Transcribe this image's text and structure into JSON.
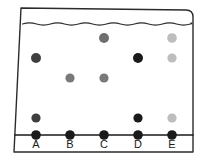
{
  "figure": {
    "background_color": "#ffffff",
    "stroke_color": "#2b2b2b",
    "stroke_width": 1.4,
    "width": 208,
    "height": 160
  },
  "container": {
    "name": "container-outline",
    "description": "Hand-drawn open-top vessel with slightly slanted left wall and rounded top-right corner",
    "left_top_x": 21,
    "left_bottom_x": 14,
    "right_x": 193,
    "top_y": 8,
    "baseline_y": 135,
    "bottom_y": 152,
    "corner_radius": 7
  },
  "fluid_line": {
    "name": "wavy-fluid-line",
    "y": 24,
    "amplitude": 2.2,
    "wavelength": 14,
    "color": "#2b2b2b"
  },
  "baseline": {
    "name": "baseline-axis",
    "y": 135,
    "x_start": 15,
    "x_end": 193,
    "color": "#1a1a1a",
    "width": 1.6
  },
  "legend_colors": {
    "black": "#1a1a1a",
    "dark_gray": "#3f3f3f",
    "medium_gray": "#797979",
    "light_gray": "#bdbdbd"
  },
  "chart_data": {
    "type": "scatter",
    "xlabel": "",
    "ylabel": "",
    "categories": [
      "A",
      "B",
      "C",
      "D",
      "E"
    ],
    "grid": false,
    "legend_position": "none",
    "column_x": [
      36,
      70,
      104,
      138,
      172
    ],
    "anchor_y": 135,
    "levels": {
      "L1": 38,
      "L2": 58,
      "L3": 78,
      "L4": 118,
      "L5": 135
    },
    "points": [
      {
        "column": "A",
        "level": "L2",
        "x": 36,
        "y": 58,
        "shade": "dark_gray",
        "color": "#3f3f3f",
        "radius": 5.0
      },
      {
        "column": "A",
        "level": "L4",
        "x": 36,
        "y": 118,
        "shade": "dark_gray",
        "color": "#3f3f3f",
        "radius": 4.6
      },
      {
        "column": "A",
        "level": "L5",
        "x": 36,
        "y": 135,
        "shade": "black",
        "color": "#1a1a1a",
        "radius": 4.8
      },
      {
        "column": "B",
        "level": "L3",
        "x": 70,
        "y": 78,
        "shade": "medium_gray",
        "color": "#797979",
        "radius": 4.6
      },
      {
        "column": "B",
        "level": "L5",
        "x": 70,
        "y": 135,
        "shade": "black",
        "color": "#1a1a1a",
        "radius": 4.8
      },
      {
        "column": "C",
        "level": "L1",
        "x": 104,
        "y": 38,
        "shade": "medium_gray",
        "color": "#6f6f6f",
        "radius": 5.0
      },
      {
        "column": "C",
        "level": "L3",
        "x": 104,
        "y": 78,
        "shade": "medium_gray",
        "color": "#797979",
        "radius": 4.6
      },
      {
        "column": "C",
        "level": "L5",
        "x": 104,
        "y": 135,
        "shade": "black",
        "color": "#1a1a1a",
        "radius": 4.8
      },
      {
        "column": "D",
        "level": "L2",
        "x": 138,
        "y": 58,
        "shade": "black",
        "color": "#1a1a1a",
        "radius": 5.0
      },
      {
        "column": "D",
        "level": "L4",
        "x": 138,
        "y": 118,
        "shade": "black",
        "color": "#1a1a1a",
        "radius": 4.6
      },
      {
        "column": "D",
        "level": "L5",
        "x": 138,
        "y": 135,
        "shade": "black",
        "color": "#1a1a1a",
        "radius": 4.8
      },
      {
        "column": "E",
        "level": "L1",
        "x": 172,
        "y": 38,
        "shade": "light_gray",
        "color": "#bdbdbd",
        "radius": 4.8
      },
      {
        "column": "E",
        "level": "L2",
        "x": 172,
        "y": 58,
        "shade": "light_gray",
        "color": "#bdbdbd",
        "radius": 4.6
      },
      {
        "column": "E",
        "level": "L4",
        "x": 172,
        "y": 118,
        "shade": "light_gray",
        "color": "#bdbdbd",
        "radius": 4.6
      },
      {
        "column": "E",
        "level": "L5",
        "x": 172,
        "y": 135,
        "shade": "black",
        "color": "#1a1a1a",
        "radius": 4.8
      }
    ],
    "tick_labels": [
      {
        "text": "A",
        "x": 36,
        "y": 148
      },
      {
        "text": "B",
        "x": 70,
        "y": 148
      },
      {
        "text": "C",
        "x": 104,
        "y": 148
      },
      {
        "text": "D",
        "x": 138,
        "y": 148
      },
      {
        "text": "E",
        "x": 172,
        "y": 148
      }
    ]
  }
}
